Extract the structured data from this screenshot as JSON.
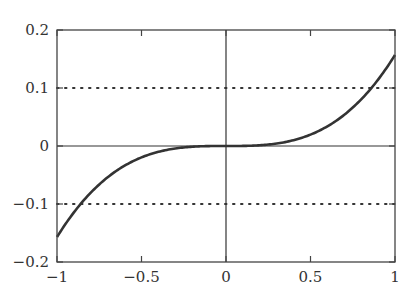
{
  "chart_data": {
    "type": "line",
    "title": "",
    "xlabel": "",
    "ylabel": "",
    "xlim": [
      -1,
      1
    ],
    "ylim": [
      -0.2,
      0.2
    ],
    "grid": false,
    "legend": null,
    "x_ticks": [
      -1,
      -0.5,
      0,
      0.5,
      1
    ],
    "x_tick_labels": [
      "−1",
      "−0.5",
      "0",
      "0.5",
      "1"
    ],
    "y_ticks": [
      -0.2,
      -0.1,
      0,
      0.1,
      0.2
    ],
    "y_tick_labels": [
      "−0.2",
      "−0.1",
      "0",
      "0.1",
      "0.2"
    ],
    "series": [
      {
        "name": "cubic curve",
        "style": "solid",
        "color": "#333333",
        "x": [
          -1,
          -0.9,
          -0.8,
          -0.7,
          -0.6,
          -0.5,
          -0.4,
          -0.3,
          -0.2,
          -0.1,
          0,
          0.1,
          0.2,
          0.3,
          0.4,
          0.5,
          0.6,
          0.7,
          0.8,
          0.9,
          1
        ],
        "y": [
          -0.157,
          -0.1145,
          -0.0804,
          -0.0539,
          -0.0339,
          -0.0196,
          -0.01,
          -0.0042,
          -0.0013,
          -0.0002,
          0,
          0.0002,
          0.0013,
          0.0042,
          0.01,
          0.0196,
          0.0339,
          0.0539,
          0.0804,
          0.1145,
          0.157
        ]
      }
    ],
    "reference_lines": [
      {
        "orientation": "horizontal",
        "y": 0.1,
        "style": "dotted"
      },
      {
        "orientation": "horizontal",
        "y": -0.1,
        "style": "dotted"
      },
      {
        "orientation": "horizontal",
        "y": 0,
        "style": "solid"
      },
      {
        "orientation": "vertical",
        "x": 0,
        "style": "solid"
      }
    ]
  }
}
